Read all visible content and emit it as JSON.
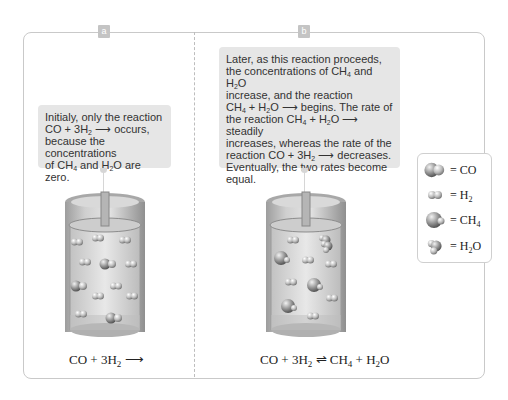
{
  "panels": [
    {
      "tag": "a",
      "callout": {
        "line1": "Initialy, only the reaction",
        "line2_pre": "CO + 3H",
        "line2_sub": "2",
        "line2_post": " ⟶ occurs,",
        "line3": "because the concentrations",
        "line4_a": "of CH",
        "line4_sub1": "4",
        "line4_b": " and H",
        "line4_sub2": "2",
        "line4_c": "O are zero."
      },
      "equation": {
        "a": "CO + 3H",
        "sub": "2",
        "b": " ⟶"
      }
    },
    {
      "tag": "b",
      "callout": {
        "l1": "Later, as this reaction proceeds,",
        "l2a": "the concentrations of CH",
        "l2s1": "4",
        "l2b": " and H",
        "l2s2": "2",
        "l2c": "O",
        "l3": "increase, and the reaction",
        "l4a": "CH",
        "l4s1": "4",
        "l4b": " + H",
        "l4s2": "2",
        "l4c": "O ⟶ begins. The rate of",
        "l5a": "the reaction CH",
        "l5s1": "4",
        "l5b": " + H",
        "l5s2": "2",
        "l5c": "O ⟶ steadily",
        "l6": "increases, whereas the rate of the",
        "l7a": "reaction CO + 3H",
        "l7s": "2",
        "l7b": " ⟶ decreases.",
        "l8": "Eventually, the two rates become",
        "l9": "equal."
      },
      "equation": {
        "a": "CO + 3H",
        "s1": "2",
        "b": " ⇌ CH",
        "s2": "4",
        "c": " + H",
        "s3": "2",
        "d": "O"
      }
    }
  ],
  "legend": {
    "items": [
      {
        "icon": "co-molecule-icon",
        "label": "= CO",
        "sub": "",
        "post": ""
      },
      {
        "icon": "h2-molecule-icon",
        "label": "= H",
        "sub": "2",
        "post": ""
      },
      {
        "icon": "ch4-molecule-icon",
        "label": "= CH",
        "sub": "4",
        "post": ""
      },
      {
        "icon": "h2o-molecule-icon",
        "label": "= H",
        "sub": "2",
        "post": "O"
      }
    ]
  },
  "colors": {
    "frame": "#c9c9c9",
    "callout_bg": "#e6e6e6",
    "tag_bg": "#c4c4c4",
    "molecule": "#8a8a8a"
  }
}
